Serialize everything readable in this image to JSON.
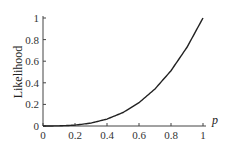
{
  "chart_data": {
    "type": "line",
    "title": "",
    "xlabel": "p",
    "ylabel": "Likelihood",
    "xlim": [
      0,
      1
    ],
    "ylim": [
      0,
      1
    ],
    "grid": false,
    "legend": null,
    "x_ticks": [
      "0",
      "0.2",
      "0.4",
      "0.6",
      "0.8",
      "1"
    ],
    "y_ticks": [
      "0",
      "0.2",
      "0.4",
      "0.6",
      "0.8",
      "1"
    ],
    "series": [
      {
        "name": "Likelihood",
        "x": [
          0,
          0.1,
          0.2,
          0.3,
          0.4,
          0.5,
          0.6,
          0.7,
          0.8,
          0.9,
          1.0
        ],
        "values": [
          0,
          0.001,
          0.008,
          0.027,
          0.064,
          0.125,
          0.216,
          0.343,
          0.512,
          0.729,
          1.0
        ]
      }
    ]
  }
}
